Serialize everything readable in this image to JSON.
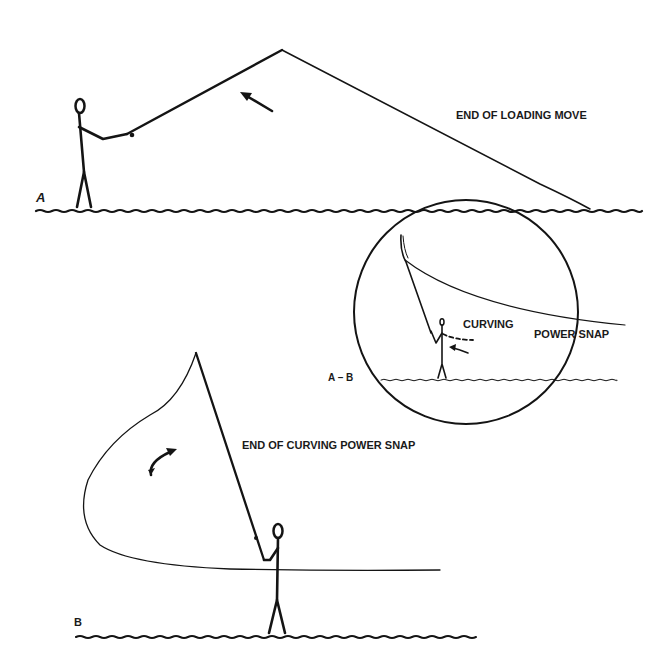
{
  "colors": {
    "ink": "#141414",
    "background": "#ffffff"
  },
  "panel_a": {
    "label": "A",
    "caption": "END OF LOADING MOVE"
  },
  "inset": {
    "label": "A – B",
    "caption_line1": "CURVING",
    "caption_line2": "POWER SNAP"
  },
  "panel_b": {
    "label": "B",
    "caption": "END OF CURVING POWER SNAP"
  },
  "icons": {
    "panel_a_arrow": "straight-arrow-up-left",
    "inset_arrow": "arrow-left",
    "panel_b_arrow": "curved-arrow-up-right"
  }
}
